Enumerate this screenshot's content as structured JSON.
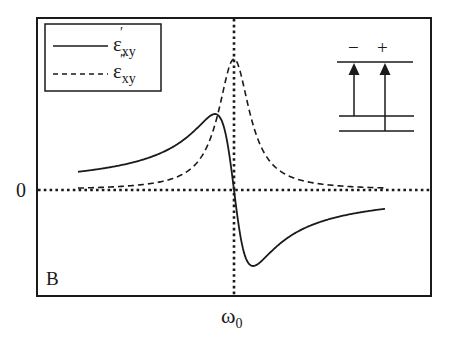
{
  "figure": {
    "panel_label": "B",
    "y_zero_label": "0",
    "x_center_label_base": "ω",
    "x_center_label_sub": "0",
    "colors": {
      "ink": "#1a1a1a",
      "background": "#ffffff"
    }
  },
  "legend": {
    "items": [
      {
        "style": "solid",
        "symbol": "ε",
        "prime": "′",
        "sub": "xy",
        "label": "ε′xy"
      },
      {
        "style": "dashed",
        "symbol": "ε",
        "prime": "″",
        "sub": "xy",
        "label": "ε″xy"
      }
    ]
  },
  "level_diagram": {
    "labels": [
      "−",
      "+"
    ],
    "levels": [
      "upper",
      "lower-1",
      "lower-2"
    ],
    "transitions": [
      {
        "label": "−",
        "from": "lower-1",
        "to": "upper"
      },
      {
        "label": "+",
        "from": "lower-2",
        "to": "upper"
      }
    ]
  },
  "chart_data": {
    "type": "line",
    "title": "",
    "xlabel": "ω",
    "ylabel": "",
    "x_tick_labels": [
      "ω0"
    ],
    "y_tick_labels": [
      "0"
    ],
    "grid": false,
    "legend_position": "upper left",
    "reference_lines": [
      {
        "orientation": "horizontal",
        "at": 0,
        "style": "dotted"
      },
      {
        "orientation": "vertical",
        "at": "ω0",
        "style": "dotted"
      }
    ],
    "x_units": "(ω − ω0)/γ",
    "x": [
      -8,
      -6,
      -4,
      -3,
      -2,
      -1.5,
      -1,
      -0.5,
      0,
      0.5,
      1,
      1.5,
      2,
      3,
      4,
      6,
      8
    ],
    "series": [
      {
        "name": "ε′xy",
        "style": "solid",
        "description": "dispersive lineshape: positive lobe below ω0, negative lobe above ω0",
        "values": [
          -0.14,
          -0.19,
          -0.27,
          -0.35,
          -0.46,
          -0.54,
          -0.58,
          -0.46,
          0,
          0.46,
          0.58,
          0.54,
          0.46,
          0.35,
          0.27,
          0.19,
          0.14
        ],
        "sign_note": "plotted with positive lobe at ω<ω0 (values shown as −f so that f(-1)=+0.58 at left)"
      },
      {
        "name": "ε″xy",
        "style": "dashed",
        "description": "absorptive Lorentzian peaked at ω0",
        "values": [
          0.015,
          0.027,
          0.059,
          0.1,
          0.2,
          0.31,
          0.5,
          0.8,
          1.0,
          0.8,
          0.5,
          0.31,
          0.2,
          0.1,
          0.059,
          0.027,
          0.015
        ]
      }
    ],
    "extrema": {
      "dispersive_max": {
        "x": -1,
        "y": 0.58
      },
      "dispersive_min": {
        "x": 1,
        "y": -0.58
      },
      "absorptive_peak": {
        "x": 0,
        "y": 1.0
      }
    },
    "ylim": [
      -0.7,
      1.15
    ],
    "xlim": [
      -8.5,
      10.5
    ]
  }
}
